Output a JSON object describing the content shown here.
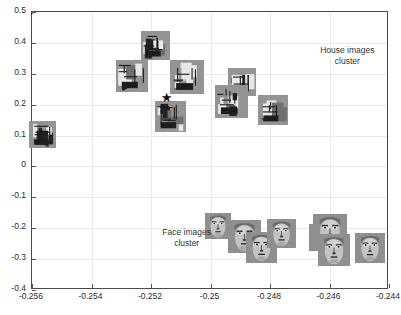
{
  "chart_data": {
    "type": "scatter",
    "title": "",
    "xlabel": "",
    "ylabel": "",
    "xlim": [
      -0.256,
      -0.244
    ],
    "ylim": [
      -0.4,
      0.5
    ],
    "grid": true,
    "legend": "none",
    "x_ticks": [
      "-0.256",
      "-0.254",
      "-0.252",
      "-0.25",
      "-0.248",
      "-0.246",
      "-0.244"
    ],
    "x_tick_values": [
      -0.256,
      -0.254,
      -0.252,
      -0.25,
      -0.248,
      -0.246,
      -0.244
    ],
    "y_ticks": [
      "0.5",
      "0.4",
      "0.3",
      "0.2",
      "0.1",
      "0",
      "-0.1",
      "-0.2",
      "-0.3",
      "-0.4"
    ],
    "y_tick_values": [
      0.5,
      0.4,
      0.3,
      0.2,
      0.1,
      0,
      -0.1,
      -0.2,
      -0.3,
      -0.4
    ],
    "annotations": [
      {
        "text_line1": "House images",
        "text_line2": "cluster",
        "x": -0.2454,
        "y": 0.375
      },
      {
        "text_line1": "Face images",
        "text_line2": "cluster",
        "x": -0.2508,
        "y": -0.215
      }
    ],
    "series": [
      {
        "name": "House images cluster",
        "marker": "image-thumbnail",
        "thumbnail_kind": "house",
        "points": [
          {
            "x": -0.25565,
            "y": 0.105
          },
          {
            "x": -0.25265,
            "y": 0.293
          },
          {
            "x": -0.25185,
            "y": 0.393
          },
          {
            "x": -0.2508,
            "y": 0.29
          },
          {
            "x": -0.25135,
            "y": 0.163
          },
          {
            "x": -0.24895,
            "y": 0.275
          },
          {
            "x": -0.2493,
            "y": 0.21
          },
          {
            "x": -0.2479,
            "y": 0.182
          }
        ]
      },
      {
        "name": "House cluster centroid",
        "marker": "star",
        "points": [
          {
            "x": -0.25145,
            "y": 0.222
          }
        ]
      },
      {
        "name": "Face images cluster",
        "marker": "image-thumbnail",
        "thumbnail_kind": "face",
        "points": [
          {
            "x": -0.24975,
            "y": -0.192
          },
          {
            "x": -0.24885,
            "y": -0.228
          },
          {
            "x": -0.2483,
            "y": -0.262
          },
          {
            "x": -0.2476,
            "y": -0.218
          },
          {
            "x": -0.24625,
            "y": -0.23
          },
          {
            "x": -0.246,
            "y": -0.208
          },
          {
            "x": -0.24585,
            "y": -0.272
          },
          {
            "x": -0.24465,
            "y": -0.265
          }
        ]
      }
    ],
    "cluster_ellipses": [
      {
        "name": "house-cluster-ellipse",
        "cx": -0.25215,
        "cy": 0.225,
        "rx_px": 178,
        "ry_px": 72,
        "rotation_deg": -25,
        "color": "#585858"
      },
      {
        "name": "face-cluster-ellipse",
        "cx": -0.2476,
        "cy": -0.238,
        "rx_px": 99,
        "ry_px": 41,
        "rotation_deg": -6,
        "color": "#9a9a9a"
      }
    ]
  },
  "axes": {
    "frame_color": "#4a4a4a",
    "grid_color": "#e9e9e9",
    "tick_label_color": "#2b2b2b"
  }
}
